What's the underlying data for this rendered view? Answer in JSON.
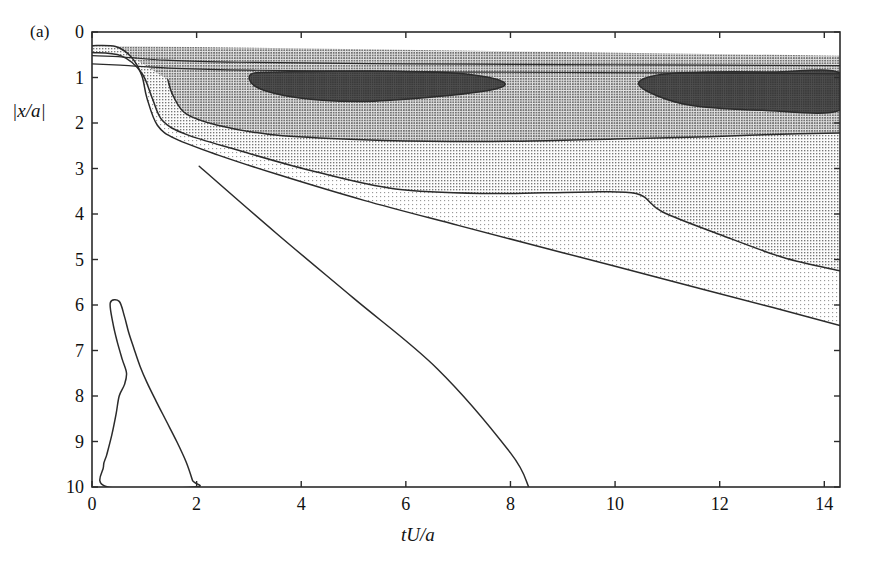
{
  "figure": {
    "panel_label": "(a)",
    "background_color": "#ffffff",
    "line_color": "#2b2b2b"
  },
  "axes": {
    "x_label": "tU/a",
    "y_label": "|x/a|",
    "x_ticks": [
      "0",
      "2",
      "4",
      "6",
      "8",
      "10",
      "12",
      "14"
    ],
    "y_ticks": [
      "0",
      "1",
      "2",
      "3",
      "4",
      "5",
      "6",
      "7",
      "8",
      "9",
      "10"
    ]
  },
  "shading": {
    "level_0_white": "#ffffff",
    "level_1_light": "#e7e7e7",
    "level_2_medium": "#c9c9c9",
    "level_3_gray": "#a9a9a9",
    "level_4_dark": "#4a4a4a"
  },
  "chart_data": {
    "type": "contour",
    "title": "",
    "xlabel": "tU/a",
    "ylabel": "|x/a|",
    "xlim": [
      0,
      14.3
    ],
    "ylim": [
      0,
      10
    ],
    "y_inverted": true,
    "grid": false,
    "legend": "none",
    "x_ticks": [
      0,
      2,
      4,
      6,
      8,
      10,
      12,
      14
    ],
    "y_ticks": [
      0,
      1,
      2,
      3,
      4,
      5,
      6,
      7,
      8,
      9,
      10
    ],
    "shading_levels": [
      "white",
      "light-stipple",
      "medium-gray",
      "gray",
      "dark"
    ],
    "contours": [
      {
        "name": "outer-band-top-1",
        "level": 1,
        "points": [
          [
            0,
            0.52
          ],
          [
            0.6,
            0.55
          ],
          [
            1.4,
            0.62
          ],
          [
            2.6,
            0.66
          ],
          [
            4.0,
            0.68
          ],
          [
            6.0,
            0.7
          ],
          [
            8.0,
            0.71
          ],
          [
            10.0,
            0.72
          ],
          [
            12.0,
            0.73
          ],
          [
            14.3,
            0.74
          ]
        ]
      },
      {
        "name": "outer-band-top-2",
        "level": 2,
        "points": [
          [
            0,
            0.7
          ],
          [
            0.7,
            0.74
          ],
          [
            1.6,
            0.8
          ],
          [
            3.0,
            0.84
          ],
          [
            5.0,
            0.86
          ],
          [
            7.0,
            0.88
          ],
          [
            9.0,
            0.89
          ],
          [
            11.0,
            0.9
          ],
          [
            14.3,
            0.92
          ]
        ]
      },
      {
        "name": "contour-outermost-left-lobe",
        "level": 1,
        "points": [
          [
            0.0,
            0.3
          ],
          [
            0.45,
            0.32
          ],
          [
            0.75,
            0.55
          ],
          [
            0.95,
            0.95
          ],
          [
            1.05,
            1.45
          ],
          [
            1.25,
            2.05
          ],
          [
            1.6,
            2.35
          ],
          [
            2.4,
            2.7
          ],
          [
            3.6,
            3.15
          ],
          [
            5.2,
            3.7
          ],
          [
            7.0,
            4.25
          ],
          [
            9.0,
            4.85
          ],
          [
            11.0,
            5.45
          ],
          [
            13.0,
            6.05
          ],
          [
            14.3,
            6.45
          ]
        ]
      },
      {
        "name": "contour-mid-left-lobe",
        "level": 2,
        "points": [
          [
            0.0,
            0.45
          ],
          [
            0.55,
            0.52
          ],
          [
            0.95,
            0.9
          ],
          [
            1.15,
            1.45
          ],
          [
            1.35,
            1.95
          ],
          [
            1.8,
            2.25
          ],
          [
            2.8,
            2.6
          ],
          [
            4.2,
            3.05
          ],
          [
            5.8,
            3.45
          ],
          [
            7.6,
            3.55
          ],
          [
            9.3,
            3.52
          ],
          [
            10.4,
            3.55
          ],
          [
            10.9,
            3.95
          ],
          [
            12.0,
            4.45
          ],
          [
            13.2,
            4.95
          ],
          [
            14.3,
            5.25
          ]
        ]
      },
      {
        "name": "contour-inner-lobe",
        "level": 3,
        "points": [
          [
            1.45,
            1.05
          ],
          [
            1.55,
            1.4
          ],
          [
            1.8,
            1.8
          ],
          [
            2.4,
            2.05
          ],
          [
            3.4,
            2.25
          ],
          [
            4.8,
            2.35
          ],
          [
            6.4,
            2.4
          ],
          [
            8.2,
            2.4
          ],
          [
            10.0,
            2.35
          ],
          [
            11.8,
            2.3
          ],
          [
            13.0,
            2.25
          ],
          [
            14.3,
            2.22
          ]
        ]
      },
      {
        "name": "dark-core-1",
        "level": 4,
        "points": [
          [
            3.05,
            0.92
          ],
          [
            3.6,
            0.88
          ],
          [
            4.6,
            0.86
          ],
          [
            5.8,
            0.86
          ],
          [
            6.9,
            0.9
          ],
          [
            7.6,
            1.0
          ],
          [
            7.9,
            1.15
          ],
          [
            7.6,
            1.28
          ],
          [
            6.6,
            1.42
          ],
          [
            5.4,
            1.52
          ],
          [
            4.4,
            1.5
          ],
          [
            3.6,
            1.38
          ],
          [
            3.1,
            1.18
          ]
        ]
      },
      {
        "name": "dark-core-2",
        "level": 4,
        "points": [
          [
            10.45,
            1.12
          ],
          [
            10.9,
            0.93
          ],
          [
            11.8,
            0.88
          ],
          [
            13.0,
            0.88
          ],
          [
            14.3,
            0.9
          ],
          [
            14.3,
            1.72
          ],
          [
            12.8,
            1.72
          ],
          [
            11.5,
            1.62
          ],
          [
            10.8,
            1.4
          ]
        ]
      },
      {
        "name": "triangular-closed-loop-lower-left",
        "level": 1,
        "points": [
          [
            0.35,
            5.95
          ],
          [
            0.52,
            5.92
          ],
          [
            0.62,
            6.25
          ],
          [
            0.7,
            6.6
          ],
          [
            0.8,
            6.95
          ],
          [
            0.92,
            7.35
          ],
          [
            1.05,
            7.7
          ],
          [
            1.22,
            8.1
          ],
          [
            1.42,
            8.55
          ],
          [
            1.62,
            9.0
          ],
          [
            1.8,
            9.45
          ],
          [
            1.92,
            9.85
          ],
          [
            1.95,
            10.0
          ],
          [
            0.3,
            10.0
          ],
          [
            0.22,
            9.55
          ],
          [
            0.28,
            9.3
          ],
          [
            0.38,
            8.85
          ],
          [
            0.46,
            8.4
          ],
          [
            0.52,
            8.0
          ],
          [
            0.62,
            7.75
          ],
          [
            0.66,
            7.5
          ],
          [
            0.58,
            7.2
          ],
          [
            0.48,
            6.8
          ],
          [
            0.4,
            6.4
          ]
        ]
      },
      {
        "name": "straight-diagonal-contour",
        "level": 1,
        "points": [
          [
            2.05,
            2.95
          ],
          [
            3.5,
            4.4
          ],
          [
            5.0,
            5.85
          ],
          [
            6.6,
            7.4
          ],
          [
            8.0,
            9.25
          ],
          [
            8.35,
            10.0
          ]
        ]
      }
    ],
    "annotations": [
      {
        "text": "(a)",
        "x_px": 30,
        "y_px": 22,
        "role": "panel-label"
      }
    ]
  }
}
